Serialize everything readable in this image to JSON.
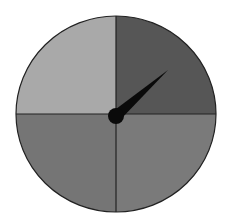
{
  "spinner": {
    "sections": [
      {
        "name": "top-left",
        "color": "#a9a9a9"
      },
      {
        "name": "top-right",
        "color": "#565656"
      },
      {
        "name": "bottom-left",
        "color": "#757575"
      },
      {
        "name": "bottom-right",
        "color": "#7a7a7a"
      }
    ],
    "pointer": {
      "color": "#0a0a0a",
      "angle_deg": 50
    },
    "outline_color": "#222222"
  }
}
